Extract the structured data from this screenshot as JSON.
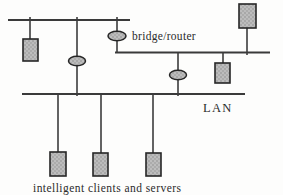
{
  "diagram": {
    "type": "network-topology",
    "labels": {
      "bridge_router": "bridge/router",
      "lan": "LAN",
      "caption": "intelligent clients and servers"
    },
    "colors": {
      "background": "#fdfdfc",
      "line": "#3a3a3a",
      "node_fill": "#b9b9b9",
      "node_stroke": "#262626",
      "text": "#2b2b2b"
    },
    "inventory": {
      "segment_count": 3,
      "client_node_count": 6,
      "bridge_node_count": 3
    }
  }
}
